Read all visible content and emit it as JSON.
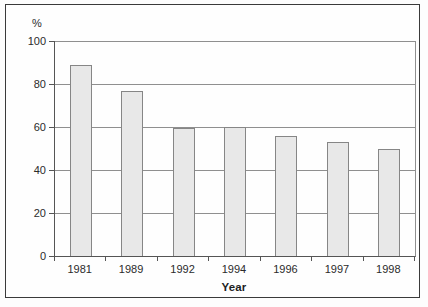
{
  "figure": {
    "unit_label": "%",
    "x_axis_title": "Year"
  },
  "chart_data": {
    "type": "bar",
    "title": "",
    "categories": [
      "1981",
      "1989",
      "1992",
      "1994",
      "1996",
      "1997",
      "1998"
    ],
    "values": [
      89,
      77,
      59.5,
      60,
      56,
      53,
      50
    ],
    "xlabel": "Year",
    "ylabel": "%",
    "ylim": [
      0,
      100
    ],
    "yticks": [
      0,
      20,
      40,
      60,
      80,
      100
    ],
    "grid": true,
    "legend": "none",
    "bar_fill": "#e8e8e8",
    "bar_border": "#868686",
    "gridline_color": "#8f8f8f",
    "axis_color": "#555555",
    "frame_border_color": "#3a3a3a",
    "text_color": "#2b2b2b"
  }
}
